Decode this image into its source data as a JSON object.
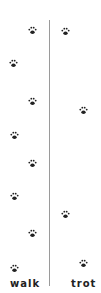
{
  "labels": {
    "left": "walk",
    "right": "trot"
  },
  "colors": {
    "paw": "#222222",
    "divider": "#9a9a9a"
  },
  "paws": {
    "walk": [
      [
        32,
        24
      ],
      [
        13,
        57
      ],
      [
        32,
        95
      ],
      [
        14,
        129
      ],
      [
        32,
        157
      ],
      [
        14,
        190
      ],
      [
        32,
        227
      ],
      [
        14,
        262
      ]
    ],
    "trot": [
      [
        65,
        25
      ],
      [
        83,
        104
      ],
      [
        65,
        208
      ],
      [
        83,
        257
      ]
    ]
  },
  "icon": "paw-print-icon"
}
